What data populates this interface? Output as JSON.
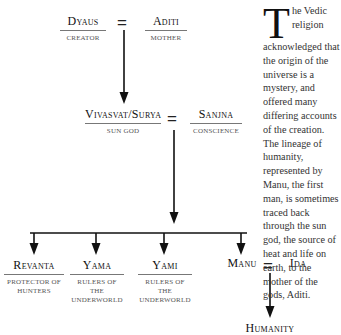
{
  "diagram": {
    "generation1": {
      "left": {
        "name": "Dyaus",
        "role": "Creator"
      },
      "right": {
        "name": "Aditi",
        "role": "Mother"
      },
      "union_symbol": "="
    },
    "generation2": {
      "left": {
        "name": "Vivasvat/Surya",
        "role": "Sun god"
      },
      "right": {
        "name": "Sanjna",
        "role": "Conscience"
      },
      "union_symbol": "="
    },
    "children": [
      {
        "name": "Revanta",
        "role_line1": "Protector of",
        "role_line2": "hunters"
      },
      {
        "name": "Yama",
        "role_line1": "Rulers of the",
        "role_line2": "underworld"
      },
      {
        "name": "Yami",
        "role_line1": "Rulers of the",
        "role_line2": "underworld"
      },
      {
        "name": "Manu"
      }
    ],
    "manu_union": {
      "partner": "Ida",
      "union_symbol": "="
    },
    "descendant": {
      "name": "Humanity"
    }
  },
  "text": {
    "dropcap": "T",
    "body": "he Vedic religion acknowledged that the origin of the universe is a mystery, and offered many differing accounts of the creation. The lineage of humanity, represented by Manu, the first man, is sometimes traced back through the sun god, the source of heat and life on earth, to the mother of the gods, Aditi."
  }
}
